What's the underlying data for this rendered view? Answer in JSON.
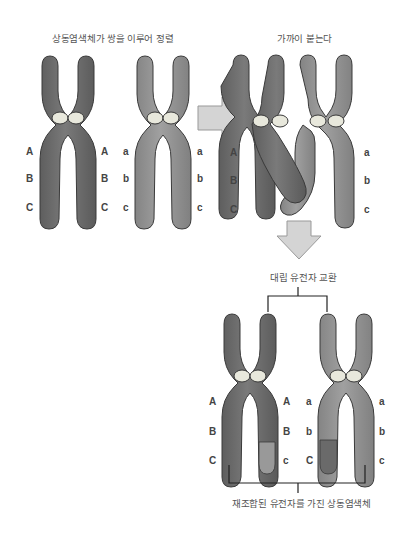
{
  "captions": {
    "pairing": "상동염색체가 쌍을 이루어 정렬",
    "close": "가까이 붙는다",
    "exchange": "대립 유전자 교환",
    "result": "재조합된 유전자를 가진 상동염색체"
  },
  "colors": {
    "dark_chromosome": "#6e6e6e",
    "light_chromosome": "#8e8e8e",
    "centromere": "#e8e8dc",
    "arrow": "#d4d4d4",
    "outline": "#3a3a3a"
  },
  "genes": {
    "dominant": [
      "A",
      "B",
      "C"
    ],
    "recessive": [
      "a",
      "b",
      "c"
    ],
    "recombined_left_right": [
      "A",
      "B",
      "c"
    ],
    "recombined_right_left": [
      "a",
      "b",
      "C"
    ]
  },
  "panels": [
    {
      "name": "homologous-pair-aligned",
      "left_labels": [
        "A",
        "B",
        "C"
      ],
      "right_labels": [
        "A",
        "B",
        "C"
      ],
      "second_left_labels": [
        "a",
        "b",
        "c"
      ],
      "second_right_labels": [
        "a",
        "b",
        "c"
      ]
    },
    {
      "name": "synapsis",
      "left_labels": [
        "A",
        "B",
        "C"
      ],
      "right_labels": [
        "a",
        "b",
        "c"
      ]
    },
    {
      "name": "recombined",
      "chrom1_left": [
        "A",
        "B",
        "C"
      ],
      "chrom1_right": [
        "A",
        "B",
        "c"
      ],
      "chrom2_left": [
        "a",
        "b",
        "C"
      ],
      "chrom2_right": [
        "a",
        "b",
        "c"
      ]
    }
  ]
}
